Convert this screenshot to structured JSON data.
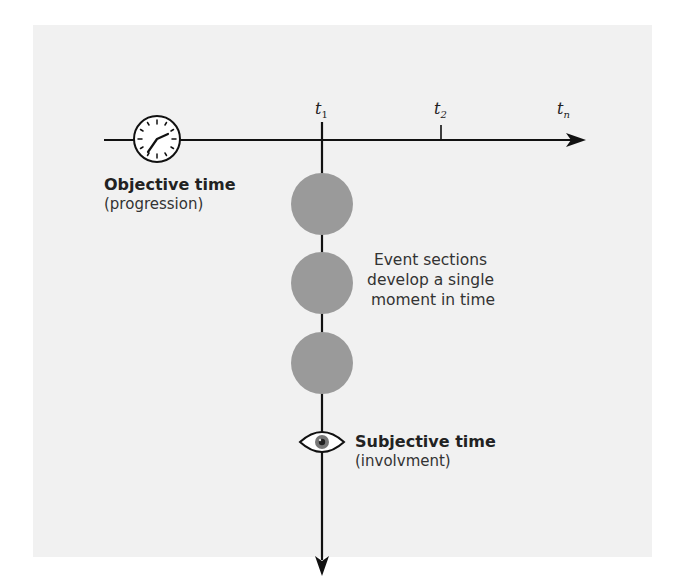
{
  "diagram": {
    "objective_axis": {
      "title": "Objective time",
      "subtitle": "(progression)",
      "icon": "clock-icon",
      "ticks": [
        {
          "base": "t",
          "sub": "1"
        },
        {
          "base": "t",
          "sub": "2"
        },
        {
          "base": "t",
          "sub": "n"
        }
      ]
    },
    "subjective_axis": {
      "title": "Subjective time",
      "subtitle": "(involvment)",
      "icon": "eye-icon"
    },
    "events": {
      "count": 3,
      "color": "#9a9a9a",
      "caption_lines": [
        "Event sections",
        "develop a single",
        "moment in time"
      ]
    },
    "colors": {
      "panel": "#f1f1f1",
      "line": "#111111",
      "event": "#9a9a9a"
    }
  }
}
